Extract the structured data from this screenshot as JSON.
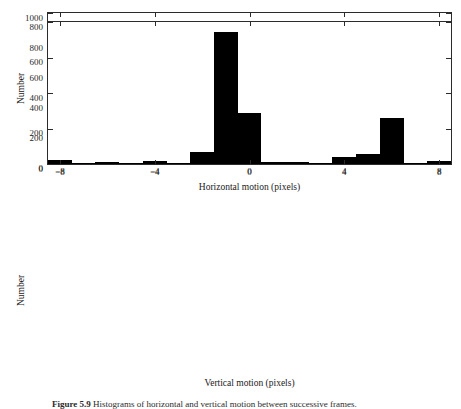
{
  "figure": {
    "caption_label": "Figure 5.9",
    "caption_text": "Histograms of horizontal and vertical motion between successive frames."
  },
  "chart_data": [
    {
      "type": "bar",
      "id": "horizontal-motion-histogram",
      "title": "",
      "xlabel": "Horizontal motion (pixels)",
      "ylabel": "Number",
      "xlim": [
        -8.5,
        8.5
      ],
      "ylim": [
        0,
        1000
      ],
      "xticks": [
        -8,
        -4,
        0,
        4,
        8
      ],
      "xticklabels": [
        "−8",
        "−4",
        "0",
        "4",
        "8"
      ],
      "yticks": [
        0,
        200,
        400,
        600,
        800,
        1000
      ],
      "yticklabels": [
        "0",
        "200",
        "400",
        "600",
        "800",
        "1000"
      ],
      "grid": false,
      "legend": "none",
      "bin_width": 1,
      "bin_centers": [
        -8,
        -7,
        -6,
        -5.5,
        -4.5,
        -3.5,
        -3,
        -2,
        -1,
        0,
        1,
        2,
        3,
        4,
        5,
        6,
        7,
        8
      ],
      "categories": [
        -8,
        -7,
        -6,
        -5,
        -4,
        -3,
        -2,
        -1,
        0,
        1,
        2,
        3,
        4,
        5,
        6,
        7,
        8
      ],
      "values": [
        12,
        3,
        10,
        920,
        360,
        6,
        4,
        2,
        38,
        3,
        4,
        5,
        14,
        60,
        75,
        20,
        16
      ]
    },
    {
      "type": "bar",
      "id": "vertical-motion-histogram",
      "title": "",
      "xlabel": "Vertical motion (pixels)",
      "ylabel": "Number",
      "xlim": [
        -8.5,
        8.5
      ],
      "ylim": [
        0,
        800
      ],
      "xticks": [
        -8,
        -4,
        0,
        4,
        8
      ],
      "xticklabels": [
        "−8",
        "−4",
        "0",
        "4",
        "8"
      ],
      "yticks": [
        0,
        200,
        400,
        600,
        800
      ],
      "yticklabels": [
        "0",
        "200",
        "400",
        "600",
        "800"
      ],
      "grid": false,
      "legend": "none",
      "bin_width": 1,
      "categories": [
        -8,
        -7,
        -6,
        -5,
        -4,
        -3,
        -2,
        -1,
        0,
        1,
        2,
        3,
        4,
        5,
        6,
        7,
        8
      ],
      "values": [
        20,
        5,
        12,
        2,
        15,
        6,
        65,
        745,
        285,
        11,
        13,
        4,
        42,
        55,
        262,
        2,
        18
      ]
    }
  ]
}
